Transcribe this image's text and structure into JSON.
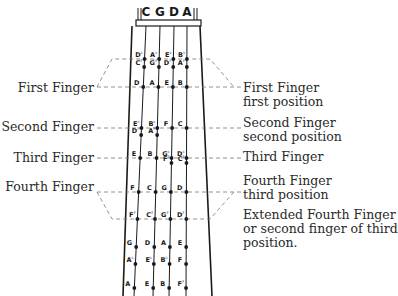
{
  "diagram": {
    "strings": [
      "C",
      "G",
      "D",
      "A"
    ],
    "rows": [
      {
        "name": "upper-flats",
        "notes": [
          {
            "n": "D",
            "acc": "b"
          },
          {
            "n": "A",
            "acc": "b"
          },
          {
            "n": "E",
            "acc": "b"
          },
          {
            "n": "B",
            "acc": "b"
          }
        ]
      },
      {
        "name": "upper-sharps",
        "notes": [
          {
            "n": "C",
            "acc": "#"
          },
          {
            "n": "G",
            "acc": "#"
          },
          {
            "n": "D",
            "acc": "#"
          },
          {
            "n": "A",
            "acc": "#"
          }
        ]
      },
      {
        "name": "first-finger",
        "notes": [
          {
            "n": "D",
            "acc": ""
          },
          {
            "n": "A",
            "acc": ""
          },
          {
            "n": "E",
            "acc": ""
          },
          {
            "n": "B",
            "acc": ""
          }
        ]
      },
      {
        "name": "second-flats",
        "notes": [
          {
            "n": "E",
            "acc": "b"
          },
          {
            "n": "B",
            "acc": "b"
          },
          {
            "n": "F",
            "acc": ""
          },
          {
            "n": "C",
            "acc": ""
          }
        ]
      },
      {
        "name": "second-sharps",
        "notes": [
          {
            "n": "D",
            "acc": "#"
          },
          {
            "n": "A",
            "acc": "#"
          },
          {
            "n": "",
            "acc": ""
          },
          {
            "n": "",
            "acc": ""
          }
        ]
      },
      {
        "name": "third-finger",
        "notes": [
          {
            "n": "E",
            "acc": ""
          },
          {
            "n": "B",
            "acc": ""
          },
          {
            "n": "G",
            "acc": "b"
          },
          {
            "n": "D",
            "acc": "b"
          }
        ]
      },
      {
        "name": "third-sharps",
        "notes": [
          {
            "n": "",
            "acc": ""
          },
          {
            "n": "",
            "acc": ""
          },
          {
            "n": "F",
            "acc": "#"
          },
          {
            "n": "C",
            "acc": "#"
          }
        ]
      },
      {
        "name": "fourth-finger",
        "notes": [
          {
            "n": "F",
            "acc": ""
          },
          {
            "n": "C",
            "acc": ""
          },
          {
            "n": "G",
            "acc": ""
          },
          {
            "n": "D",
            "acc": ""
          }
        ]
      },
      {
        "name": "extended-fourth",
        "notes": [
          {
            "n": "F",
            "acc": "#"
          },
          {
            "n": "C",
            "acc": "#"
          },
          {
            "n": "G",
            "acc": "#"
          },
          {
            "n": "D",
            "acc": "#"
          }
        ]
      },
      {
        "name": "third-pos-row1",
        "notes": [
          {
            "n": "G",
            "acc": ""
          },
          {
            "n": "D",
            "acc": ""
          },
          {
            "n": "A",
            "acc": ""
          },
          {
            "n": "E",
            "acc": ""
          }
        ]
      },
      {
        "name": "third-pos-row2",
        "notes": [
          {
            "n": "A",
            "acc": "b"
          },
          {
            "n": "E",
            "acc": "b"
          },
          {
            "n": "B",
            "acc": "b"
          },
          {
            "n": "F",
            "acc": ""
          }
        ]
      },
      {
        "name": "third-pos-row3",
        "notes": [
          {
            "n": "A",
            "acc": ""
          },
          {
            "n": "E",
            "acc": ""
          },
          {
            "n": "B",
            "acc": ""
          },
          {
            "n": "F",
            "acc": "#"
          }
        ]
      }
    ],
    "left_labels": {
      "first": "First Finger",
      "second": "Second Finger",
      "third": "Third Finger",
      "fourth": "Fourth Finger"
    },
    "right_labels": {
      "first_line1": "First Finger",
      "first_line2": "first position",
      "second_line1": "Second Finger",
      "second_line2": "second position",
      "third": "Third Finger",
      "fourth_line1": "Fourth Finger",
      "fourth_line2": "third position",
      "ext_line1": "Extended Fourth Finger",
      "ext_line2": "or second finger of third",
      "ext_line3": "position."
    },
    "colors": {
      "ink": "#1a1a1a",
      "dash": "#777777",
      "text": "#2a2a2a"
    }
  }
}
